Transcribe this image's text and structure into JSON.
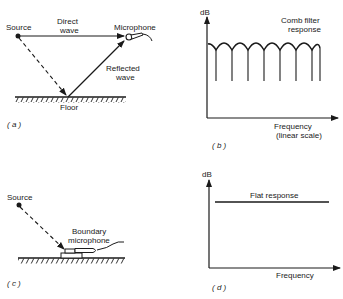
{
  "panels": {
    "a": {
      "label": "( a )",
      "source": "Source",
      "microphone": "Microphone",
      "direct_wave_line1": "Direct",
      "direct_wave_line2": "wave",
      "reflected_wave_line1": "Reflected",
      "reflected_wave_line2": "wave",
      "floor": "Floor"
    },
    "b": {
      "label": "( b )",
      "y_axis": "dB",
      "curve_line1": "Comb filter",
      "curve_line2": "response",
      "x_axis_line1": "Frequency",
      "x_axis_line2": "(linear scale)"
    },
    "c": {
      "label": "( c )",
      "source": "Source",
      "mic_line1": "Boundary",
      "mic_line2": "microphone"
    },
    "d": {
      "label": "( d )",
      "y_axis": "dB",
      "curve": "Flat response",
      "x_axis": "Frequency"
    }
  },
  "colors": {
    "ink": "#1a1a1a",
    "background": "#ffffff"
  }
}
